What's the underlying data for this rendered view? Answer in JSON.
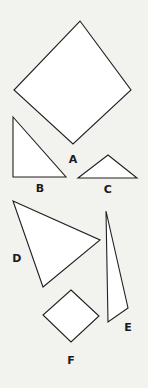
{
  "figure": {
    "width": 148,
    "height": 388,
    "background_color": "#f2f2ef",
    "shape_fill_color": "#ffffff",
    "shape_stroke_color": "#231f20",
    "label_color": "#1a1a1a"
  },
  "shapes": [
    {
      "label": "A",
      "kind": "square-rotated-diamond",
      "sides": 4,
      "points": "80,21 131,90 73,144 14,90",
      "label_x": 73,
      "label_y": 159
    },
    {
      "label": "B",
      "kind": "right-triangle",
      "sides": 3,
      "points": "13,117 66,177 13,177",
      "label_x": 40,
      "label_y": 188
    },
    {
      "label": "C",
      "kind": "isosceles-triangle",
      "sides": 3,
      "points": "108,155 137,178 78,178",
      "label_x": 108,
      "label_y": 189
    },
    {
      "label": "D",
      "kind": "scalene-triangle",
      "sides": 3,
      "points": "13,201 100,240 43,287",
      "label_x": 17,
      "label_y": 258
    },
    {
      "label": "E",
      "kind": "thin-scalene-triangle",
      "sides": 3,
      "points": "106,211 128,308 108,322",
      "label_x": 128,
      "label_y": 327
    },
    {
      "label": "F",
      "kind": "square-rotated-diamond",
      "sides": 4,
      "points": "71,290 99,316 71,342 43,315",
      "label_x": 71,
      "label_y": 360
    }
  ]
}
